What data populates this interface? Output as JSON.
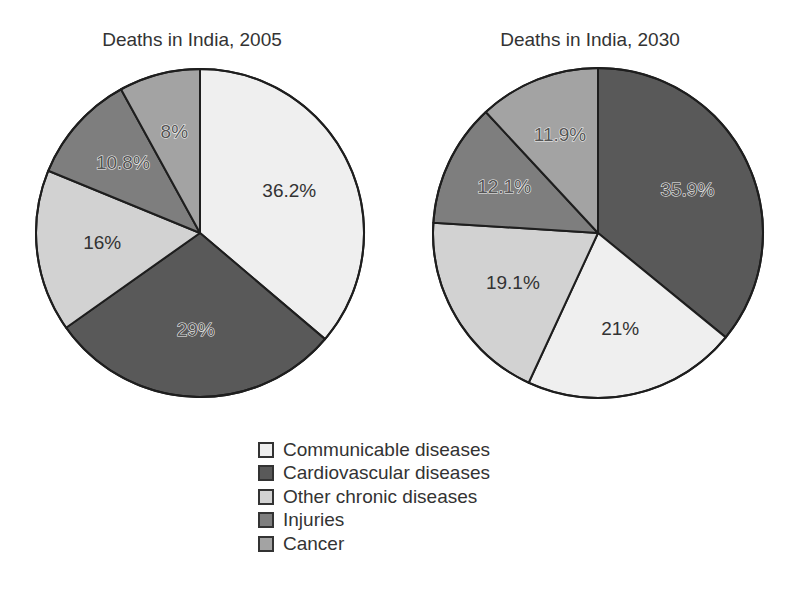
{
  "chart_data": [
    {
      "type": "pie",
      "title": "Deaths in India, 2005",
      "start_angle_deg": 0,
      "direction": "clockwise",
      "center": [
        200,
        233
      ],
      "radius": 164,
      "slices": [
        {
          "category": "Communicable diseases",
          "value": 36.2,
          "label": "36.2%"
        },
        {
          "category": "Cardiovascular diseases",
          "value": 29.0,
          "label": "29%"
        },
        {
          "category": "Other chronic diseases",
          "value": 16.0,
          "label": "16%"
        },
        {
          "category": "Injuries",
          "value": 10.8,
          "label": "10.8%"
        },
        {
          "category": "Cancer",
          "value": 8.0,
          "label": "8%"
        }
      ]
    },
    {
      "type": "pie",
      "title": "Deaths in India, 2030",
      "start_angle_deg": 0,
      "direction": "clockwise",
      "center": [
        598,
        233
      ],
      "radius": 165,
      "slices": [
        {
          "category": "Cardiovascular diseases",
          "value": 35.9,
          "label": "35.9%"
        },
        {
          "category": "Communicable diseases",
          "value": 21.0,
          "label": "21%"
        },
        {
          "category": "Other chronic diseases",
          "value": 19.1,
          "label": "19.1%"
        },
        {
          "category": "Injuries",
          "value": 12.1,
          "label": "12.1%"
        },
        {
          "category": "Cancer",
          "value": 11.9,
          "label": "11.9%"
        }
      ]
    }
  ],
  "legend": {
    "position": "bottom-center",
    "items": [
      {
        "label": "Communicable diseases",
        "color": "#efefef"
      },
      {
        "label": "Cardiovascular diseases",
        "color": "#595959"
      },
      {
        "label": "Other chronic diseases",
        "color": "#d2d2d2"
      },
      {
        "label": "Injuries",
        "color": "#7e7e7e"
      },
      {
        "label": "Cancer",
        "color": "#a3a3a3"
      }
    ]
  },
  "label_style": {
    "dark_categories": [
      "Cardiovascular diseases",
      "Injuries",
      "Cancer"
    ]
  }
}
